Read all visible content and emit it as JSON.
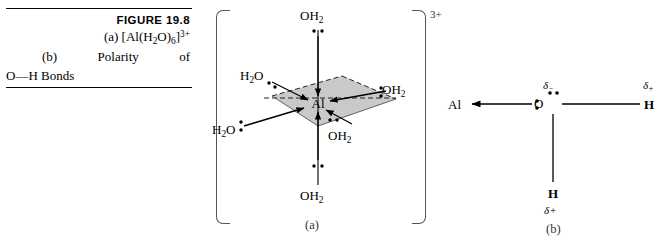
{
  "caption": {
    "figure_number": "FIGURE 19.8",
    "line_a": "(a)",
    "line_a_formula_prefix": "[Al(H",
    "line_a_formula_sub1": "2",
    "line_a_formula_mid": "O)",
    "line_a_formula_sub2": "6",
    "line_a_formula_close": "]",
    "line_a_charge": "3+",
    "line_b_label": "(b)",
    "line_b_word1": "Polarity",
    "line_b_word2": "of",
    "line_c": "O—H Bonds"
  },
  "panel_a": {
    "label": "(a)",
    "charge": "3+",
    "center_atom": "Al",
    "ligands": [
      {
        "id": "axial-top",
        "text": "OH2",
        "display": "OH",
        "sub": "2",
        "lone_pair": "below"
      },
      {
        "id": "axial-bottom",
        "text": "OH2",
        "display": "OH",
        "sub": "2",
        "lone_pair": "above"
      },
      {
        "id": "equatorial-back-left",
        "text": "H2O",
        "display": "H",
        "sub": "2",
        "tail": "O",
        "lone_pair": "lower-right"
      },
      {
        "id": "equatorial-front-left",
        "text": "H2O",
        "display": "H",
        "sub": "2",
        "tail": "O",
        "lone_pair": "right"
      },
      {
        "id": "equatorial-back-right",
        "text": "OH2",
        "display": "OH",
        "sub": "2",
        "lone_pair": "left"
      },
      {
        "id": "equatorial-front-right",
        "text": "OH2",
        "display": "OH",
        "sub": "2",
        "lone_pair": "above"
      }
    ],
    "plane_fill": "#c9c9c9",
    "plane_note": "shaded equatorial parallelogram with dashed rear edges"
  },
  "panel_b": {
    "label": "(b)",
    "left_atom": "Al",
    "center_atom": "O",
    "right_atom": "H",
    "bottom_atom": "H",
    "delta_minus": "δ",
    "delta_minus_sign": "−",
    "delta_plus": "δ",
    "delta_plus_sign": "+",
    "arrow_note": "arrow from O lone pair to Al"
  },
  "colors": {
    "ink": "#000000",
    "plane_gray": "#c9c9c9",
    "bracket_gray": "#555555"
  }
}
